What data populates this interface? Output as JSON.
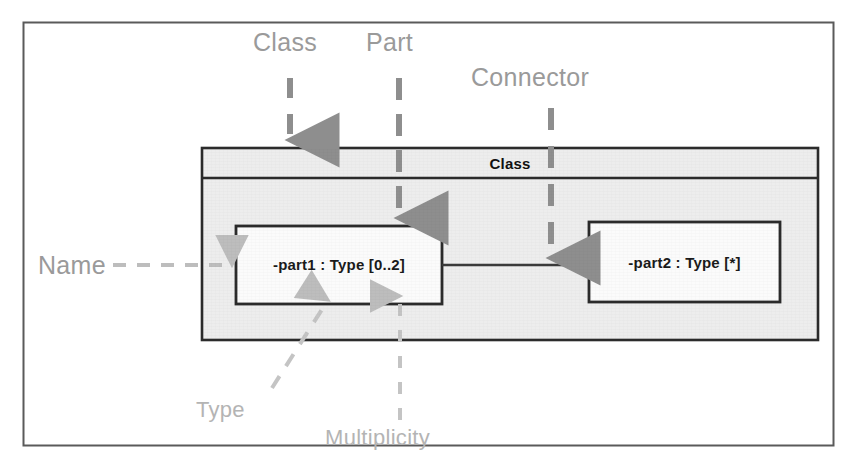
{
  "figure": {
    "kind": "uml-composite-structure-diagram",
    "frame": {
      "border_color": "#5a5a5a"
    },
    "palette": {
      "class_fill": "#ededed",
      "box_stroke": "#2b2b2b",
      "annotation_gray": "#9a9a9a",
      "annotation_light_gray": "#b4b4b4",
      "connector_stroke": "#3a3a3a",
      "background": "#ffffff"
    }
  },
  "annotations": {
    "class": "Class",
    "part": "Part",
    "connector": "Connector",
    "name": "Name",
    "type": "Type",
    "multiplicity": "Multiplicity"
  },
  "class_box": {
    "title": "Class",
    "parts": [
      {
        "label": "-part1 : Type [0..2]"
      },
      {
        "label": "-part2 : Type [*]"
      }
    ]
  }
}
